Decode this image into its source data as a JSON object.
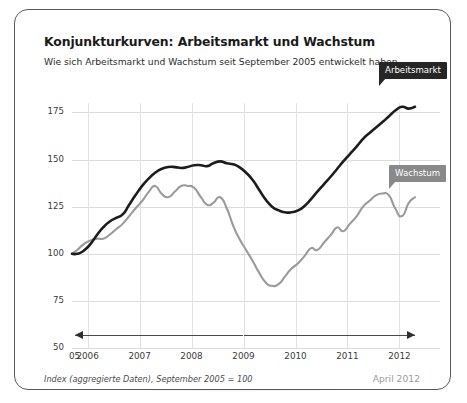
{
  "header": {
    "title": "Konjunkturkurven: Arbeitsmarkt und Wachstum",
    "subtitle": "Wie sich Arbeitsmarkt und Wachstum seit September 2005 entwickelt haben."
  },
  "footer": {
    "note": "Index (aggregierte Daten), September 2005 = 100",
    "date": "April 2012"
  },
  "labels": {
    "arbeitsmarkt": "Arbeitsmarkt",
    "wachstum": "Wachstum"
  },
  "colors": {
    "arbeitsmarkt": "#1c1c1c",
    "wachstum": "#9a9a9a",
    "grid": "#dcdcdc",
    "border": "#58585a",
    "date_text": "#9b9b9b"
  },
  "chart_data": {
    "type": "line",
    "title": "Konjunkturkurven: Arbeitsmarkt und Wachstum",
    "subtitle": "Wie sich Arbeitsmarkt und Wachstum seit September 2005 entwickelt haben.",
    "xlabel": "",
    "ylabel": "Index (aggregierte Daten), September 2005 = 100",
    "ylim": [
      50,
      180
    ],
    "yticks": [
      50,
      75,
      100,
      125,
      150,
      175
    ],
    "xticks": [
      "05",
      "2006",
      "2007",
      "2008",
      "2009",
      "2010",
      "2011",
      "2012"
    ],
    "xlim": [
      2005.7,
      2012.3
    ],
    "grid": true,
    "legend_position": "inline-callout",
    "annotations": [
      {
        "name": "left-arrow",
        "text": "",
        "from_x": 2009.0,
        "to_x": 2005.75,
        "y_value": 57
      },
      {
        "name": "right-arrow",
        "text": "",
        "from_x": 2009.0,
        "to_x": 2012.3,
        "y_value": 57
      }
    ],
    "series": [
      {
        "name": "Arbeitsmarkt",
        "color": "#1c1c1c",
        "x": [
          2005.7,
          2005.8,
          2005.92,
          2006.05,
          2006.18,
          2006.3,
          2006.42,
          2006.55,
          2006.68,
          2006.8,
          2006.92,
          2007.05,
          2007.18,
          2007.3,
          2007.42,
          2007.55,
          2007.68,
          2007.8,
          2007.92,
          2008.05,
          2008.18,
          2008.3,
          2008.42,
          2008.55,
          2008.68,
          2008.8,
          2008.92,
          2009.05,
          2009.18,
          2009.3,
          2009.42,
          2009.55,
          2009.68,
          2009.8,
          2009.92,
          2010.05,
          2010.18,
          2010.3,
          2010.42,
          2010.55,
          2010.68,
          2010.8,
          2010.92,
          2011.05,
          2011.18,
          2011.3,
          2011.42,
          2011.55,
          2011.68,
          2011.8,
          2011.92,
          2012.05,
          2012.18,
          2012.3
        ],
        "values": [
          100,
          100,
          101.5,
          105,
          110,
          114,
          117,
          119,
          121,
          126,
          131,
          136,
          140,
          143,
          145,
          146,
          146,
          145.5,
          146,
          147,
          147,
          146.5,
          148,
          149,
          148,
          147.5,
          146,
          143,
          139,
          134,
          129,
          125,
          123,
          122,
          122,
          123,
          125.5,
          129,
          133,
          137,
          141,
          145,
          149,
          153,
          157,
          161,
          164,
          167,
          170,
          173,
          176,
          178,
          177,
          178
        ]
      },
      {
        "name": "Wachstum",
        "color": "#9a9a9a",
        "x": [
          2005.7,
          2005.8,
          2005.92,
          2006.05,
          2006.18,
          2006.3,
          2006.42,
          2006.55,
          2006.68,
          2006.8,
          2006.92,
          2007.05,
          2007.18,
          2007.3,
          2007.42,
          2007.55,
          2007.68,
          2007.8,
          2007.92,
          2008.05,
          2008.18,
          2008.3,
          2008.42,
          2008.55,
          2008.68,
          2008.8,
          2008.92,
          2009.05,
          2009.18,
          2009.3,
          2009.42,
          2009.55,
          2009.68,
          2009.8,
          2009.92,
          2010.05,
          2010.18,
          2010.3,
          2010.42,
          2010.55,
          2010.68,
          2010.8,
          2010.92,
          2011.05,
          2011.18,
          2011.3,
          2011.42,
          2011.55,
          2011.68,
          2011.8,
          2011.92,
          2012.05,
          2012.18,
          2012.3
        ],
        "values": [
          100,
          102,
          105,
          107,
          108,
          108,
          110,
          113,
          116,
          120,
          124,
          128,
          133,
          136,
          132,
          130,
          133,
          136,
          136,
          135,
          130,
          126,
          127,
          130,
          124,
          115,
          108,
          102,
          96,
          90,
          85,
          83,
          84,
          88,
          92,
          95,
          99,
          103,
          102,
          106,
          110,
          114,
          112,
          116,
          120,
          125,
          128,
          131,
          132,
          131,
          124,
          120,
          127,
          130
        ]
      }
    ]
  }
}
